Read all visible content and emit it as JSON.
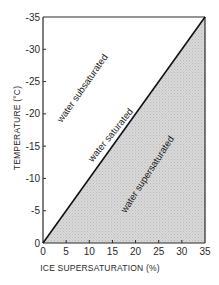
{
  "chart_data": {
    "type": "area",
    "title": "",
    "xlabel": "ICE SUPERSATURATION (%)",
    "ylabel": "TEMPERATURE (°C)",
    "xlim": [
      0,
      35
    ],
    "ylim": [
      0,
      -35
    ],
    "x_ticks": [
      0,
      5,
      10,
      15,
      20,
      25,
      30,
      35
    ],
    "x_tick_labels": [
      "0",
      "5",
      "10",
      "15",
      "20",
      "25",
      "30",
      "35"
    ],
    "y_ticks": [
      0,
      -5,
      -10,
      -15,
      -20,
      -25,
      -30,
      -35
    ],
    "y_tick_labels": [
      "0",
      "-5",
      "-10",
      "-15",
      "-20",
      "-25",
      "-30",
      "-35"
    ],
    "grid": false,
    "legend": null,
    "series": [
      {
        "name": "water saturated",
        "type": "line",
        "x": [
          0,
          35
        ],
        "y": [
          0,
          -35
        ]
      }
    ],
    "regions": [
      {
        "name": "water subsaturated",
        "fill": "none",
        "location": "above-left of line"
      },
      {
        "name": "water supersaturated",
        "fill": "stippled gray",
        "location": "below-right of line"
      }
    ],
    "annotations": [
      "water subsaturated",
      "water saturated",
      "water supersaturated"
    ]
  },
  "labels": {
    "xlabel": "ICE SUPERSATURATION (%)",
    "ylabel": "TEMPERATURE (°C)",
    "subsaturated": "water subsaturated",
    "saturated": "water saturated",
    "supersaturated": "water supersaturated"
  },
  "colors": {
    "axis": "#2a2a2a",
    "line": "#111111",
    "shade": "#d6d6d6",
    "stipple": "#b8b8b8"
  }
}
